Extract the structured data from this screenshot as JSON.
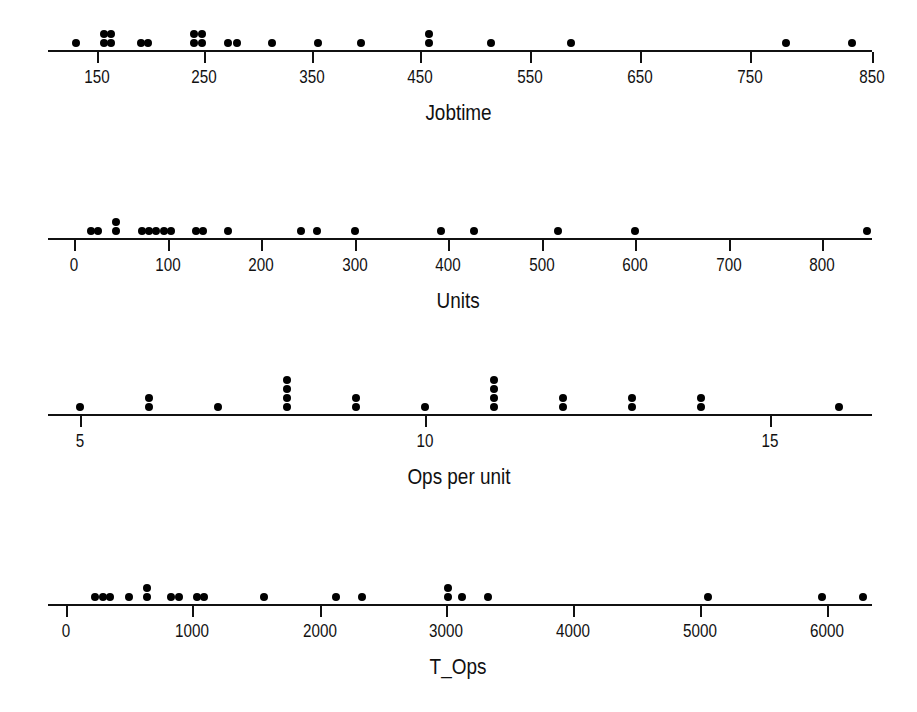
{
  "figure": {
    "background": "#ffffff",
    "ink_color": "#000000",
    "width": 917,
    "height": 712
  },
  "chart_data": [
    {
      "type": "scatter",
      "plot_kind": "dotplot",
      "title": "",
      "xlabel": "Jobtime",
      "ylabel": "",
      "grid": false,
      "legend": null,
      "xlim": [
        110,
        870
      ],
      "axis_pixel_left": 48,
      "axis_pixel_right": 872,
      "tick_values": [
        150,
        250,
        350,
        450,
        550,
        650,
        750,
        850
      ],
      "tick_labels": [
        "150",
        "250",
        "350",
        "450",
        "550",
        "650",
        "750",
        "850"
      ],
      "tick_pixels": [
        97,
        204,
        312,
        420,
        530,
        640,
        750,
        872
      ],
      "stacks": [
        {
          "value": 131,
          "count": 1
        },
        {
          "value": 156,
          "count": 2
        },
        {
          "value": 163,
          "count": 2
        },
        {
          "value": 190,
          "count": 1
        },
        {
          "value": 196,
          "count": 1
        },
        {
          "value": 238,
          "count": 2
        },
        {
          "value": 245,
          "count": 2
        },
        {
          "value": 268,
          "count": 1
        },
        {
          "value": 276,
          "count": 1
        },
        {
          "value": 308,
          "count": 1
        },
        {
          "value": 350,
          "count": 1
        },
        {
          "value": 388,
          "count": 1
        },
        {
          "value": 450,
          "count": 2
        },
        {
          "value": 506,
          "count": 1
        },
        {
          "value": 578,
          "count": 1
        },
        {
          "value": 772,
          "count": 1
        },
        {
          "value": 832,
          "count": 1
        }
      ]
    },
    {
      "type": "scatter",
      "plot_kind": "dotplot",
      "title": "",
      "xlabel": "Units",
      "ylabel": "",
      "grid": false,
      "legend": null,
      "xlim": [
        -10,
        880
      ],
      "axis_pixel_left": 48,
      "axis_pixel_right": 872,
      "tick_values": [
        0,
        100,
        200,
        300,
        400,
        500,
        600,
        700,
        800
      ],
      "tick_labels": [
        "0",
        "100",
        "200",
        "300",
        "400",
        "500",
        "600",
        "700",
        "800"
      ],
      "tick_pixels": [
        74,
        168,
        261,
        355,
        448,
        542,
        635,
        729,
        822
      ],
      "stacks": [
        {
          "value": 18,
          "count": 1
        },
        {
          "value": 26,
          "count": 1
        },
        {
          "value": 45,
          "count": 2
        },
        {
          "value": 73,
          "count": 1
        },
        {
          "value": 80,
          "count": 1
        },
        {
          "value": 88,
          "count": 1
        },
        {
          "value": 96,
          "count": 1
        },
        {
          "value": 104,
          "count": 1
        },
        {
          "value": 130,
          "count": 1
        },
        {
          "value": 138,
          "count": 1
        },
        {
          "value": 165,
          "count": 1
        },
        {
          "value": 243,
          "count": 1
        },
        {
          "value": 260,
          "count": 1
        },
        {
          "value": 300,
          "count": 1
        },
        {
          "value": 392,
          "count": 1
        },
        {
          "value": 428,
          "count": 1
        },
        {
          "value": 518,
          "count": 1
        },
        {
          "value": 600,
          "count": 1
        },
        {
          "value": 848,
          "count": 1
        }
      ]
    },
    {
      "type": "scatter",
      "plot_kind": "dotplot",
      "title": "",
      "xlabel": "Ops per unit",
      "ylabel": "",
      "grid": false,
      "legend": null,
      "xlim": [
        4.6,
        16.6
      ],
      "axis_pixel_left": 48,
      "axis_pixel_right": 872,
      "tick_values": [
        5,
        10,
        15
      ],
      "tick_labels": [
        "5",
        "10",
        "15"
      ],
      "tick_pixels": [
        80,
        425,
        770
      ],
      "stacks": [
        {
          "value": 5,
          "count": 1
        },
        {
          "value": 6,
          "count": 2
        },
        {
          "value": 7,
          "count": 1
        },
        {
          "value": 8,
          "count": 4
        },
        {
          "value": 9,
          "count": 2
        },
        {
          "value": 10,
          "count": 1
        },
        {
          "value": 11,
          "count": 4
        },
        {
          "value": 12,
          "count": 2
        },
        {
          "value": 13,
          "count": 2
        },
        {
          "value": 14,
          "count": 2
        },
        {
          "value": 16,
          "count": 1
        }
      ]
    },
    {
      "type": "scatter",
      "plot_kind": "dotplot",
      "title": "",
      "xlabel": "T_Ops",
      "ylabel": "",
      "grid": false,
      "legend": null,
      "xlim": [
        -50,
        6500
      ],
      "axis_pixel_left": 48,
      "axis_pixel_right": 872,
      "tick_values": [
        0,
        1000,
        2000,
        3000,
        4000,
        5000,
        6000
      ],
      "tick_labels": [
        "0",
        "1000",
        "2000",
        "3000",
        "4000",
        "5000",
        "6000"
      ],
      "tick_pixels": [
        66,
        192,
        320,
        446,
        573,
        700,
        827
      ],
      "stacks": [
        {
          "value": 230,
          "count": 1
        },
        {
          "value": 290,
          "count": 1
        },
        {
          "value": 350,
          "count": 1
        },
        {
          "value": 500,
          "count": 1
        },
        {
          "value": 640,
          "count": 2
        },
        {
          "value": 830,
          "count": 1
        },
        {
          "value": 890,
          "count": 1
        },
        {
          "value": 1030,
          "count": 1
        },
        {
          "value": 1090,
          "count": 1
        },
        {
          "value": 1560,
          "count": 1
        },
        {
          "value": 2130,
          "count": 1
        },
        {
          "value": 2330,
          "count": 1
        },
        {
          "value": 3010,
          "count": 2
        },
        {
          "value": 3120,
          "count": 1
        },
        {
          "value": 3330,
          "count": 1
        },
        {
          "value": 5060,
          "count": 1
        },
        {
          "value": 5960,
          "count": 1
        },
        {
          "value": 6280,
          "count": 1
        }
      ]
    }
  ],
  "panels": [
    {
      "axis_y": 50,
      "title_y": 100,
      "xlabel": "Jobtime"
    },
    {
      "axis_y": 238,
      "title_y": 288,
      "xlabel": "Units"
    },
    {
      "axis_y": 414,
      "title_y": 464,
      "xlabel": "Ops per unit"
    },
    {
      "axis_y": 604,
      "title_y": 654,
      "xlabel": "T_Ops"
    }
  ]
}
